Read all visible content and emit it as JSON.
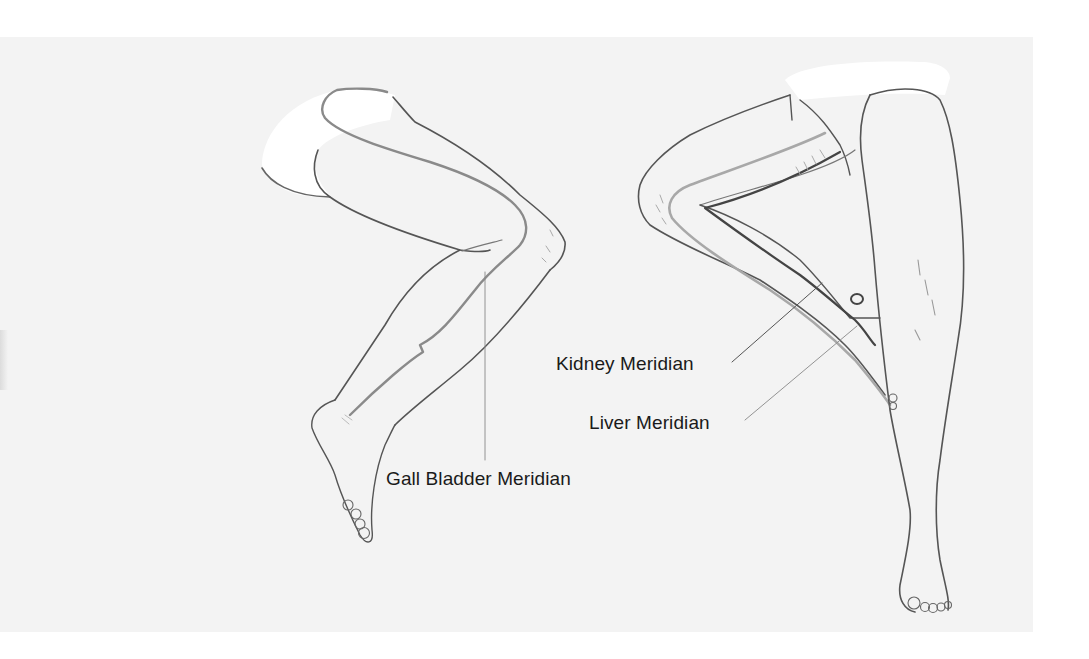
{
  "diagram": {
    "title": "",
    "figures": [
      {
        "id": "left-leg",
        "description": "Lateral view of flexed leg (thigh, knee, lower leg, foot)"
      },
      {
        "id": "right-legs",
        "description": "Medial view of flexed leg with opposite straight leg standing"
      }
    ],
    "labels": {
      "gall_bladder": "Gall Bladder Meridian",
      "kidney": "Kidney Meridian",
      "liver": "Liver Meridian"
    },
    "colors": {
      "paper": "#f3f3f3",
      "background": "#ffffff",
      "outline": "#555555",
      "gall_bladder_line": "#8a8a8a",
      "kidney_line": "#4a4a4a",
      "liver_line": "#a8a8a8",
      "leader_line": "#6a6a6a"
    }
  }
}
